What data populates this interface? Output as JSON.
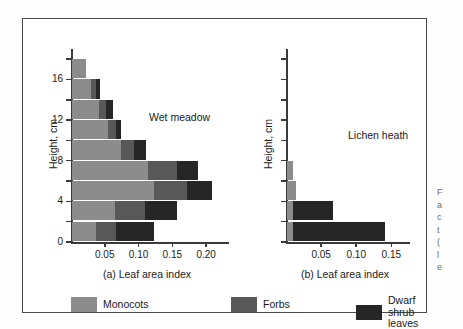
{
  "figure": {
    "legend": {
      "items": [
        {
          "label": "Monocots",
          "color": "#8c8c8c"
        },
        {
          "label": "Forbs",
          "color": "#585858"
        },
        {
          "label": "Dwarf\nshrub leaves",
          "color": "#262626"
        }
      ]
    },
    "side_caption_fragments": [
      "F",
      "a",
      "c",
      "t",
      "(",
      "l",
      "e"
    ]
  },
  "chart_data": [
    {
      "type": "bar",
      "orientation": "horizontal",
      "stacked": true,
      "panel": "a",
      "title": "Wet meadow",
      "xlabel": "(a) Leaf area index",
      "ylabel": "Height, cm",
      "xlim": [
        0,
        0.225
      ],
      "ylim": [
        0,
        19
      ],
      "xticks": [
        0.05,
        0.1,
        0.15,
        0.2
      ],
      "xticklabels": [
        "0.05",
        "0.10",
        "0.15",
        "0.20"
      ],
      "yticks": [
        0,
        2,
        4,
        6,
        8,
        10,
        12,
        14,
        16,
        18
      ],
      "yticklabels": [
        "0",
        "",
        "4",
        "",
        "8",
        "",
        "12",
        "",
        "16",
        ""
      ],
      "grid": false,
      "legend_position": "below-figure",
      "categories": [
        "0-2",
        "2-4",
        "4-6",
        "6-8",
        "8-10",
        "10-12",
        "12-14",
        "14-16",
        "16-18"
      ],
      "series": [
        {
          "name": "Monocots",
          "color": "#8c8c8c",
          "values": [
            0.035,
            0.063,
            0.122,
            0.113,
            0.072,
            0.053,
            0.04,
            0.028,
            0.021
          ]
        },
        {
          "name": "Forbs",
          "color": "#585858",
          "values": [
            0.03,
            0.045,
            0.048,
            0.042,
            0.02,
            0.012,
            0.011,
            0.008,
            0.0
          ]
        },
        {
          "name": "Dwarf shrub leaves",
          "color": "#262626",
          "values": [
            0.057,
            0.048,
            0.038,
            0.031,
            0.018,
            0.008,
            0.009,
            0.006,
            0.0
          ]
        }
      ],
      "totals": [
        0.122,
        0.156,
        0.208,
        0.186,
        0.11,
        0.073,
        0.06,
        0.042,
        0.021
      ]
    },
    {
      "type": "bar",
      "orientation": "horizontal",
      "stacked": true,
      "panel": "b",
      "title": "Lichen heath",
      "xlabel": "(b) Leaf area index",
      "ylabel": "Height, cm",
      "xlim": [
        0,
        0.168
      ],
      "ylim": [
        0,
        19
      ],
      "xticks": [
        0.05,
        0.1,
        0.15
      ],
      "xticklabels": [
        "0.05",
        "0.10",
        "0.15"
      ],
      "yticks": [
        0,
        2,
        4,
        6,
        8,
        10,
        12,
        14,
        16,
        18
      ],
      "yticklabels": [
        "",
        "",
        "",
        "",
        "",
        "",
        "",
        "",
        "",
        ""
      ],
      "grid": false,
      "legend_position": "below-figure",
      "categories": [
        "0-2",
        "2-4",
        "4-6",
        "6-8"
      ],
      "series": [
        {
          "name": "Monocots",
          "color": "#8c8c8c",
          "values": [
            0.008,
            0.008,
            0.013,
            0.009
          ]
        },
        {
          "name": "Forbs",
          "color": "#585858",
          "values": [
            0.0,
            0.0,
            0.0,
            0.0
          ]
        },
        {
          "name": "Dwarf shrub leaves",
          "color": "#262626",
          "values": [
            0.131,
            0.057,
            0.0,
            0.0
          ]
        }
      ],
      "totals": [
        0.139,
        0.065,
        0.013,
        0.009
      ]
    }
  ]
}
